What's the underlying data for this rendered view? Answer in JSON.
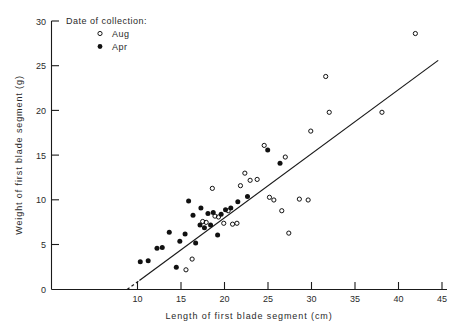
{
  "chart_data": {
    "type": "scatter",
    "title": "",
    "xlabel": "Length of first blade segment (cm)",
    "ylabel": "Weight of first blade segment (g)",
    "xlim": [
      0,
      45
    ],
    "ylim": [
      0,
      30
    ],
    "xticks": [
      0,
      10,
      15,
      20,
      25,
      30,
      35,
      40,
      45
    ],
    "yticks": [
      0,
      5,
      10,
      15,
      20,
      25,
      30
    ],
    "grid": false,
    "legend_title": "Date of collection:",
    "legend_position": "top-left",
    "series": [
      {
        "name": "Apr",
        "marker": "filled-circle",
        "color": "#111111",
        "points": [
          [
            10.1,
            3.1
          ],
          [
            11.0,
            3.2
          ],
          [
            12.0,
            4.6
          ],
          [
            12.6,
            4.7
          ],
          [
            13.4,
            6.4
          ],
          [
            14.2,
            2.5
          ],
          [
            14.6,
            5.4
          ],
          [
            15.2,
            6.2
          ],
          [
            15.6,
            9.9
          ],
          [
            16.1,
            8.3
          ],
          [
            16.4,
            5.2
          ],
          [
            16.9,
            7.2
          ],
          [
            17.0,
            9.1
          ],
          [
            17.4,
            6.9
          ],
          [
            17.8,
            8.5
          ],
          [
            18.1,
            7.2
          ],
          [
            18.4,
            8.6
          ],
          [
            18.9,
            6.1
          ],
          [
            19.3,
            8.4
          ],
          [
            19.8,
            8.9
          ],
          [
            20.4,
            9.1
          ],
          [
            21.2,
            9.8
          ],
          [
            22.3,
            10.4
          ],
          [
            24.6,
            15.6
          ],
          [
            26.0,
            14.1
          ]
        ]
      },
      {
        "name": "Aug",
        "marker": "open-circle",
        "color": "#111111",
        "points": [
          [
            15.3,
            2.2
          ],
          [
            16.0,
            3.4
          ],
          [
            17.2,
            7.6
          ],
          [
            17.6,
            7.5
          ],
          [
            18.3,
            11.3
          ],
          [
            18.6,
            8.2
          ],
          [
            19.0,
            8.1
          ],
          [
            19.6,
            7.4
          ],
          [
            20.1,
            8.8
          ],
          [
            20.6,
            7.3
          ],
          [
            21.1,
            7.4
          ],
          [
            21.5,
            11.6
          ],
          [
            22.0,
            13.0
          ],
          [
            22.6,
            12.2
          ],
          [
            23.4,
            12.3
          ],
          [
            24.2,
            16.1
          ],
          [
            24.8,
            10.3
          ],
          [
            25.3,
            10.0
          ],
          [
            26.2,
            8.8
          ],
          [
            26.6,
            14.8
          ],
          [
            27.0,
            6.3
          ],
          [
            28.2,
            10.1
          ],
          [
            29.2,
            10.0
          ],
          [
            29.5,
            17.7
          ],
          [
            31.2,
            23.8
          ],
          [
            31.6,
            19.8
          ],
          [
            37.6,
            19.8
          ],
          [
            41.4,
            28.6
          ]
        ]
      }
    ],
    "regression_line": {
      "style": "solid-with-dashed-lead",
      "x_start": 8.6,
      "y_start": 0.0,
      "x_end": 44.0,
      "y_end": 25.6,
      "dash_until_x": 10.0
    }
  },
  "axes": {
    "x_tick_labels": [
      "0",
      "10",
      "15",
      "20",
      "25",
      "30",
      "35",
      "40",
      "45"
    ],
    "y_tick_labels": [
      "0",
      "5",
      "10",
      "15",
      "20",
      "25",
      "30"
    ]
  }
}
